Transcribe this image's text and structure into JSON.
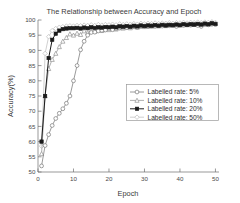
{
  "figure": {
    "title": "The Relationship between Accuracy and Epoch",
    "xlabel": "Epoch",
    "ylabel": "Accuracy(%)"
  },
  "legend": {
    "items": [
      {
        "label": "Labelled rate: 5%",
        "marker": "circle-open-gray",
        "color": "#808080"
      },
      {
        "label": "Labelled rate: 10%",
        "marker": "triangle-gray",
        "color": "#9a9a9a"
      },
      {
        "label": "Labelled rate: 20%",
        "marker": "square-filled-black",
        "color": "#1a1a1a"
      },
      {
        "label": "Labelled rate: 50%",
        "marker": "diamond-light-gray",
        "color": "#c4c4c4"
      }
    ]
  },
  "axes": {
    "x_ticks": [
      "0",
      "10",
      "20",
      "30",
      "40",
      "50"
    ],
    "y_ticks": [
      "50",
      "55",
      "60",
      "65",
      "70",
      "75",
      "80",
      "85",
      "90",
      "95",
      "100"
    ]
  },
  "chart_data": {
    "type": "line",
    "title": "The Relationship between Accuracy and Epoch",
    "xlabel": "Epoch",
    "ylabel": "Accuracy(%)",
    "xlim": [
      0,
      51
    ],
    "ylim": [
      50,
      100
    ],
    "xticks": [
      0,
      10,
      20,
      30,
      40,
      50
    ],
    "yticks": [
      50,
      55,
      60,
      65,
      70,
      75,
      80,
      85,
      90,
      95,
      100
    ],
    "grid": false,
    "legend_position": "center-right",
    "x": [
      1,
      2,
      3,
      4,
      5,
      6,
      7,
      8,
      9,
      10,
      11,
      12,
      13,
      14,
      15,
      16,
      17,
      18,
      19,
      20,
      21,
      22,
      23,
      24,
      25,
      26,
      27,
      28,
      29,
      30,
      31,
      32,
      33,
      34,
      35,
      36,
      37,
      38,
      39,
      40,
      41,
      42,
      43,
      44,
      45,
      46,
      47,
      48,
      49,
      50
    ],
    "series": [
      {
        "name": "Labelled rate: 5%",
        "color": "#808080",
        "marker": "circle-open",
        "values": [
          52.0,
          58.7,
          62.3,
          65.3,
          67.6,
          69.3,
          70.8,
          72.6,
          75.0,
          80.0,
          85.0,
          90.2,
          93.0,
          95.0,
          95.9,
          96.0,
          96.4,
          96.6,
          96.7,
          97.2,
          96.8,
          97.2,
          97.4,
          97.6,
          97.5,
          97.7,
          97.8,
          97.6,
          97.9,
          98.0,
          97.8,
          98.1,
          97.9,
          98.2,
          98.0,
          98.3,
          98.1,
          98.3,
          97.9,
          98.4,
          98.2,
          98.4,
          98.3,
          98.5,
          98.2,
          97.9,
          98.5,
          98.4,
          98.6,
          98.5
        ]
      },
      {
        "name": "Labelled rate: 10%",
        "color": "#9a9a9a",
        "marker": "triangle",
        "values": [
          56.0,
          75.0,
          84.0,
          87.0,
          89.0,
          91.2,
          93.0,
          94.2,
          95.4,
          95.0,
          95.6,
          95.2,
          96.4,
          95.8,
          96.5,
          96.2,
          96.8,
          96.5,
          97.0,
          96.8,
          97.2,
          97.0,
          97.4,
          97.3,
          97.6,
          97.4,
          97.8,
          97.6,
          98.0,
          97.8,
          98.1,
          97.9,
          98.2,
          98.0,
          98.3,
          98.1,
          98.4,
          98.2,
          98.5,
          98.3,
          98.6,
          98.4,
          98.6,
          98.5,
          98.7,
          98.5,
          98.8,
          98.6,
          99.0,
          98.8
        ]
      },
      {
        "name": "Labelled rate: 20%",
        "color": "#1a1a1a",
        "marker": "square-filled",
        "values": [
          60.0,
          75.0,
          87.5,
          93.5,
          95.5,
          96.5,
          97.0,
          97.2,
          97.3,
          97.3,
          97.4,
          97.2,
          97.5,
          97.3,
          97.6,
          97.4,
          97.6,
          97.5,
          97.7,
          97.6,
          97.8,
          97.6,
          97.9,
          97.8,
          98.0,
          97.8,
          98.1,
          97.9,
          98.2,
          98.0,
          98.2,
          98.1,
          98.3,
          98.1,
          98.4,
          98.2,
          98.4,
          98.3,
          98.5,
          98.3,
          98.6,
          98.4,
          98.6,
          98.5,
          98.7,
          98.5,
          98.8,
          98.6,
          98.9,
          98.7
        ]
      },
      {
        "name": "Labelled rate: 50%",
        "color": "#c4c4c4",
        "marker": "diamond",
        "values": [
          58.5,
          89.0,
          94.5,
          96.5,
          97.2,
          97.6,
          97.8,
          98.0,
          98.1,
          98.0,
          98.2,
          98.1,
          98.3,
          98.2,
          98.4,
          98.2,
          98.5,
          98.3,
          98.5,
          98.4,
          98.6,
          98.4,
          98.7,
          98.5,
          98.7,
          98.6,
          98.8,
          98.6,
          98.9,
          98.7,
          98.9,
          98.8,
          99.0,
          98.8,
          99.0,
          98.9,
          99.1,
          98.9,
          99.1,
          99.0,
          99.2,
          99.0,
          99.2,
          99.1,
          99.3,
          99.1,
          99.3,
          99.2,
          99.4,
          99.2
        ]
      }
    ]
  }
}
